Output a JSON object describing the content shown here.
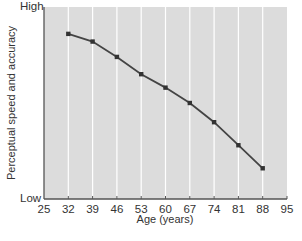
{
  "chart_data": {
    "type": "line",
    "title": "",
    "xlabel": "Age (years)",
    "ylabel": "Perceptual speed and accuracy",
    "x_ticks": [
      25,
      32,
      39,
      46,
      53,
      60,
      67,
      74,
      81,
      88,
      95
    ],
    "xlim": [
      25,
      95
    ],
    "y_tick_labels": {
      "top": "High",
      "bottom": "Low"
    },
    "ylim": [
      0,
      100
    ],
    "grid": {
      "vertical": true,
      "horizontal": false
    },
    "legend": null,
    "series": [
      {
        "name": "Perceptual speed and accuracy",
        "x": [
          32,
          39,
          46,
          53,
          60,
          67,
          74,
          81,
          88
        ],
        "values": [
          86,
          82,
          74,
          65,
          58,
          50,
          40,
          28,
          16
        ]
      }
    ],
    "colors": {
      "plot_background": "#dcdcdc",
      "gridline": "#ffffff",
      "line": "#444444",
      "marker": "#333333",
      "axis": "#555555"
    }
  },
  "labels": {
    "ylabel": "Perceptual speed and accuracy",
    "high": "High",
    "low": "Low",
    "xlabel": "Age (years)"
  }
}
